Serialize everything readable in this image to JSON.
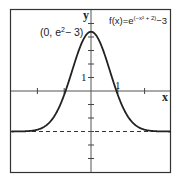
{
  "chart_data": {
    "type": "line",
    "title": "",
    "function_label": "f(x)=e^(−x²+2)−3",
    "function_label_parts": {
      "prefix": "f(x)=e",
      "exponent": "(−x² + 2)",
      "suffix": "−3"
    },
    "xlabel": "x",
    "ylabel": "y",
    "xlim": [
      -3,
      3
    ],
    "ylim": [
      -6,
      6
    ],
    "grid": false,
    "legend": "none",
    "x_ticks": [
      -2,
      -1,
      1,
      2
    ],
    "y_ticks": [
      -5,
      -4,
      -3,
      -2,
      -1,
      1,
      2,
      3,
      4,
      5
    ],
    "tick_labels": [
      {
        "axis": "x",
        "value": 1,
        "text": "1"
      },
      {
        "axis": "y",
        "value": 1,
        "text": "1"
      }
    ],
    "annotations": [
      {
        "text": "(0, e²−3)",
        "x": 0,
        "y": 4.389,
        "parts": {
          "prefix": "(0, e",
          "sup": "2",
          "suffix": "− 3)"
        }
      }
    ],
    "asymptote": {
      "type": "horizontal",
      "y": -3,
      "style": "dashed"
    },
    "series": [
      {
        "name": "f(x)=e^(−x²+2)−3",
        "x": [
          -3,
          -2.5,
          -2,
          -1.75,
          -1.5,
          -1.25,
          -1,
          -0.75,
          -0.5,
          -0.25,
          0,
          0.25,
          0.5,
          0.75,
          1,
          1.25,
          1.5,
          1.75,
          2,
          2.5,
          3
        ],
        "y": [
          -3.0,
          -2.985,
          -2.865,
          -2.658,
          -2.213,
          -1.526,
          -0.282,
          1.211,
          2.755,
          3.931,
          4.389,
          3.931,
          2.755,
          1.211,
          -0.282,
          -1.526,
          -2.213,
          -2.658,
          -2.865,
          -2.985,
          -3.0
        ]
      }
    ]
  },
  "labels": {
    "y_axis": "y",
    "x_axis": "x",
    "y_tick_one": "1",
    "x_tick_one": "1",
    "peak_prefix": "(0, e",
    "peak_sup": "2",
    "peak_suffix": "− 3)",
    "func_prefix": "f(x)=e",
    "func_exp": "(−x² + 2)",
    "func_suffix": "−3"
  }
}
